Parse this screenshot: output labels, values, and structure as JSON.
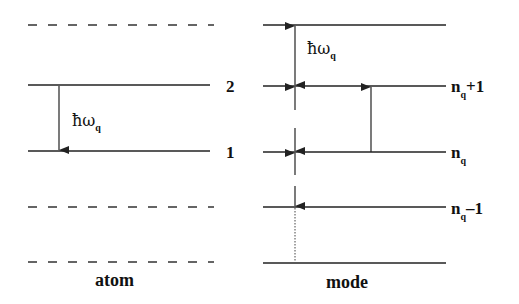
{
  "atom": {
    "title": "atom",
    "level_upper": "2",
    "level_lower": "1",
    "transition_label": "ħω",
    "transition_sub": "q"
  },
  "mode": {
    "title": "mode",
    "level_nq_plus_1": {
      "base": "n",
      "sub": "q",
      "suffix": "+1"
    },
    "level_nq": {
      "base": "n",
      "sub": "q",
      "suffix": ""
    },
    "level_nq_minus_1": {
      "base": "n",
      "sub": "q",
      "suffix": "–1"
    },
    "spacing_label": "ħω",
    "spacing_sub": "q"
  },
  "colors": {
    "line": "#222222",
    "background": "#ffffff"
  }
}
